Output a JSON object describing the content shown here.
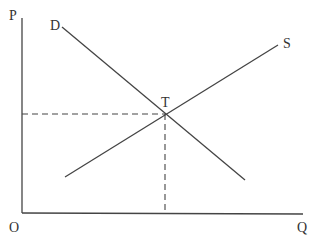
{
  "diagram": {
    "axes": {
      "y_label": "P",
      "x_label": "Q",
      "origin_label": "O"
    },
    "curves": [
      {
        "name": "demand",
        "label": "D"
      },
      {
        "name": "supply",
        "label": "S"
      }
    ],
    "equilibrium": {
      "label": "T"
    },
    "colors": {
      "line": "#444444",
      "background": "#ffffff"
    }
  }
}
